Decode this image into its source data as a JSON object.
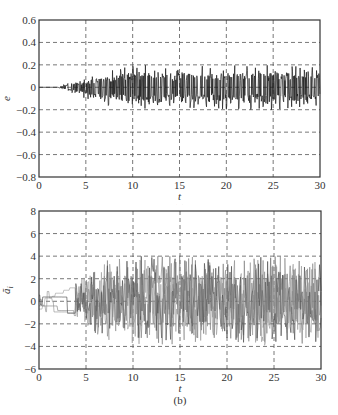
{
  "chart_data": [
    {
      "type": "line",
      "panel_label": "(a)",
      "title": "",
      "xlabel": "t",
      "ylabel": "e",
      "xlim": [
        0,
        30
      ],
      "ylim": [
        -0.8,
        0.6
      ],
      "xticks": [
        0,
        5,
        10,
        15,
        20,
        25,
        30
      ],
      "xtick_labels": [
        "0",
        "5",
        "10",
        "15",
        "20",
        "25",
        "30"
      ],
      "yticks": [
        0.6,
        0.4,
        0.2,
        0,
        -0.2,
        -0.4,
        -0.6,
        -0.8
      ],
      "ytick_labels": [
        "0.6",
        "0.4",
        "0.2",
        "0",
        "-0.2",
        "-0.4",
        "-0.6",
        "-0.8"
      ],
      "grid": true,
      "grid_style": "dashed",
      "series": [
        {
          "name": "e",
          "description": "tracking error; zero until t≈2, then dense oscillation whose envelope grows to about ±0.2 by t≈10 and stays roughly constant to t=30",
          "envelope": {
            "t": [
              0,
              2,
              3,
              5,
              8,
              10,
              15,
              20,
              25,
              30
            ],
            "upper": [
              0,
              0.0,
              0.04,
              0.08,
              0.16,
              0.2,
              0.2,
              0.2,
              0.2,
              0.2
            ],
            "lower": [
              0,
              0.0,
              -0.04,
              -0.1,
              -0.18,
              -0.2,
              -0.18,
              -0.2,
              -0.2,
              -0.18
            ]
          }
        }
      ]
    },
    {
      "type": "line",
      "panel_label": "(b)",
      "title": "",
      "xlabel": "t",
      "ylabel": "ã_i",
      "xlim": [
        0,
        30
      ],
      "ylim": [
        -6,
        8
      ],
      "xticks": [
        0,
        5,
        10,
        15,
        20,
        25,
        30
      ],
      "xtick_labels": [
        "0",
        "5",
        "10",
        "15",
        "20",
        "25",
        "30"
      ],
      "yticks": [
        8,
        6,
        4,
        2,
        0,
        -2,
        -4,
        -6
      ],
      "ytick_labels": [
        "8",
        "6",
        "4",
        "2",
        "0",
        "-2",
        "-4",
        "-6"
      ],
      "grid": true,
      "grid_style": "dashed",
      "series": [
        {
          "name": "ã_i (multiple parameter estimation errors)",
          "description": "step-like values between -1 and 1 for t<3, widening to about ±2 by t≈5, then dense noisy oscillation with envelope about +4 / -4 from t≈7 to t=30",
          "envelope": {
            "t": [
              0,
              2,
              3,
              5,
              7,
              10,
              15,
              20,
              25,
              30
            ],
            "upper": [
              1,
              1,
              1.8,
              2.2,
              3.6,
              4,
              4,
              3.8,
              4.2,
              3.8
            ],
            "lower": [
              -1,
              -1,
              -1.5,
              -2,
              -3.6,
              -4,
              -3.8,
              -3.6,
              -4,
              -3.6
            ]
          }
        }
      ]
    }
  ],
  "captions": {
    "a": "(a)",
    "b": "(b)"
  },
  "axis_labels": {
    "a_x": "t",
    "a_y": "e",
    "b_x": "t",
    "b_y": "ã",
    "b_y_sub": "i"
  },
  "colors": {
    "line": "#1a1a1a",
    "line_light": "#777777",
    "grid": "#555555",
    "frame": "#333333"
  }
}
